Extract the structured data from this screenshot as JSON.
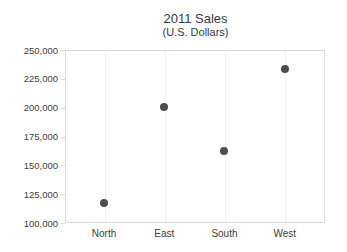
{
  "chart_data": {
    "type": "scatter",
    "title": "2011 Sales",
    "subtitle": "(U.S. Dollars)",
    "categories": [
      "North",
      "East",
      "South",
      "West"
    ],
    "values": [
      117000,
      201000,
      162000,
      233500
    ],
    "xlabel": "",
    "ylabel": "",
    "ylim": [
      100000,
      250000
    ],
    "ytick_step": 25000,
    "ytick_labels": [
      "100,000",
      "125,000",
      "150,000",
      "175,000",
      "200,000",
      "225,000",
      "250,000"
    ],
    "grid": "faint-vertical-at-categories",
    "legend": "none",
    "marker": "circle"
  },
  "colors": {
    "background": "#ffffff",
    "dot": "#4d4d4d",
    "axis_border": "#d9d9d9",
    "gridline": "#f0f0f0",
    "tick_label": "#404040",
    "title_text": "#3a3a3a"
  }
}
